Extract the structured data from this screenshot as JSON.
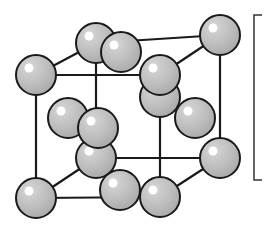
{
  "diagram": {
    "type": "crystal-lattice",
    "structure": "face-centered cubic unit cell",
    "colors": {
      "background": "#ffffff",
      "atom_fill": "#bdbdbd",
      "atom_stroke": "#1a1a1a",
      "highlight": "#ffffff",
      "bond": "#1a1a1a"
    },
    "atom_radius": 20,
    "bonds": [
      {
        "x1": 36,
        "y1": 75,
        "x2": 160,
        "y2": 75
      },
      {
        "x1": 36,
        "y1": 75,
        "x2": 96,
        "y2": 43
      },
      {
        "x1": 96,
        "y1": 43,
        "x2": 220,
        "y2": 35
      },
      {
        "x1": 160,
        "y1": 75,
        "x2": 220,
        "y2": 35
      },
      {
        "x1": 36,
        "y1": 75,
        "x2": 36,
        "y2": 198
      },
      {
        "x1": 160,
        "y1": 75,
        "x2": 160,
        "y2": 197
      },
      {
        "x1": 220,
        "y1": 35,
        "x2": 220,
        "y2": 158
      },
      {
        "x1": 96,
        "y1": 43,
        "x2": 96,
        "y2": 158
      },
      {
        "x1": 36,
        "y1": 198,
        "x2": 160,
        "y2": 197
      },
      {
        "x1": 36,
        "y1": 198,
        "x2": 96,
        "y2": 158
      },
      {
        "x1": 96,
        "y1": 158,
        "x2": 220,
        "y2": 158
      },
      {
        "x1": 160,
        "y1": 197,
        "x2": 220,
        "y2": 158
      }
    ],
    "atoms": [
      {
        "name": "corner-back-bottom-left",
        "cx": 96,
        "cy": 158
      },
      {
        "name": "corner-back-top-left",
        "cx": 96,
        "cy": 43
      },
      {
        "name": "face-center-left",
        "cx": 68,
        "cy": 118
      },
      {
        "name": "corner-back-top-right",
        "cx": 220,
        "cy": 35
      },
      {
        "name": "face-center-back",
        "cx": 160,
        "cy": 97
      },
      {
        "name": "face-center-top",
        "cx": 121,
        "cy": 52
      },
      {
        "name": "corner-front-top-left",
        "cx": 36,
        "cy": 75
      },
      {
        "name": "face-center-front",
        "cx": 98,
        "cy": 128
      },
      {
        "name": "face-center-right",
        "cx": 195,
        "cy": 118
      },
      {
        "name": "corner-front-top-right",
        "cx": 160,
        "cy": 75
      },
      {
        "name": "corner-back-bottom-right",
        "cx": 220,
        "cy": 158
      },
      {
        "name": "face-center-bottom",
        "cx": 120,
        "cy": 190
      },
      {
        "name": "corner-front-bottom-left",
        "cx": 36,
        "cy": 198
      },
      {
        "name": "corner-front-bottom-right",
        "cx": 160,
        "cy": 197
      }
    ],
    "bracket": {
      "x": 254,
      "y_top": 15,
      "y_bottom": 180,
      "tick": 8
    }
  }
}
